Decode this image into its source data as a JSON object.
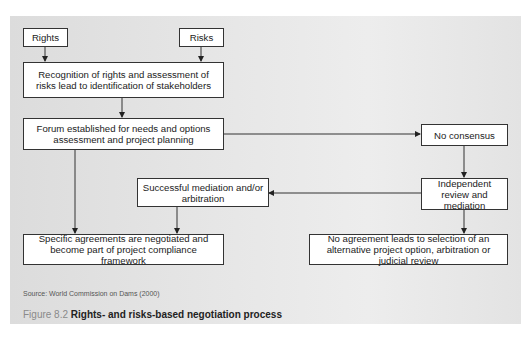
{
  "header_fragment": "ing ...",
  "diagram": {
    "nodes": {
      "rights": "Rights",
      "risks": "Risks",
      "recognition": "Recognition of rights and assessment of risks lead to identification of stakeholders",
      "forum": "Forum established for needs and options assessment and project planning",
      "no_consensus": "No consensus",
      "independent_review": "Independent review and mediation",
      "successful_mediation": "Successful mediation and/or arbitration",
      "specific_agreements": "Specific agreements are negotiated and become part of project compliance framework",
      "no_agreement": "No agreement leads to selection of an alternative project option, arbitration or judicial review"
    },
    "edges": [
      [
        "rights",
        "recognition"
      ],
      [
        "risks",
        "recognition"
      ],
      [
        "recognition",
        "forum"
      ],
      [
        "forum",
        "no_consensus"
      ],
      [
        "forum",
        "specific_agreements"
      ],
      [
        "no_consensus",
        "independent_review"
      ],
      [
        "independent_review",
        "successful_mediation"
      ],
      [
        "independent_review",
        "no_agreement"
      ],
      [
        "successful_mediation",
        "specific_agreements"
      ]
    ]
  },
  "source": "Source: World Commission on Dams (2000)",
  "caption": {
    "figure_label": "Figure 8.2",
    "title": "Rights- and risks-based negotiation process"
  }
}
